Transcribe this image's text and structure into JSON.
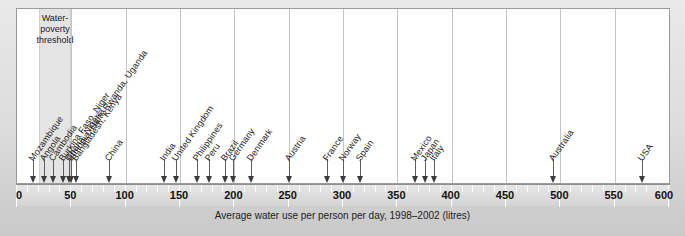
{
  "chart_data": {
    "type": "scatter",
    "title": "",
    "subtitle": "",
    "xlabel": "Average water use per person per day, 1998–2002 (litres)",
    "ylabel": "",
    "xlim": [
      0,
      600
    ],
    "xticks": [
      0,
      50,
      100,
      150,
      200,
      250,
      300,
      350,
      400,
      450,
      500,
      550,
      600
    ],
    "minor_tick_step": 10,
    "grid": "vertical-major",
    "legend": "none",
    "annotations": [
      {
        "label": "Water-poverty threshold",
        "range": [
          20,
          50
        ],
        "type": "shaded-band"
      }
    ],
    "categories": [
      "Mozambique",
      "Angola",
      "Cambodia",
      "Burkina Faso",
      "Ghana",
      "Ethiopia",
      "Nigeria",
      "Haiti",
      "Niger",
      "Rwanda",
      "Bangladesh",
      "Uganda",
      "Kenya",
      "China",
      "India",
      "United Kingdom",
      "Philippines",
      "Peru",
      "Brazil",
      "Germany",
      "Denmark",
      "Austria",
      "France",
      "Norway",
      "Spain",
      "Mexico",
      "Japan",
      "Italy",
      "Australia",
      "USA"
    ],
    "values": [
      15,
      25,
      33,
      42,
      50,
      50,
      50,
      50,
      50,
      50,
      50,
      50,
      50,
      85,
      135,
      145,
      165,
      175,
      190,
      195,
      215,
      250,
      285,
      300,
      315,
      366,
      374,
      383,
      493,
      575
    ],
    "marker_groups": [
      {
        "label": "Mozambique",
        "x": 15
      },
      {
        "label": "Angola",
        "x": 25
      },
      {
        "label": "Cambodia",
        "x": 33
      },
      {
        "label": "Burkina Faso",
        "x": 42
      },
      {
        "label": "Ghana, Nigeria",
        "x": 50
      },
      {
        "label": "Ethiopia, Haiti, Rwanda, Uganda",
        "x": 50
      },
      {
        "label": "Bangladesh, Kenya",
        "x": 50
      },
      {
        "label": "Niger",
        "x": 50
      },
      {
        "label": "China",
        "x": 85
      },
      {
        "label": "India",
        "x": 135
      },
      {
        "label": "United Kingdom",
        "x": 145
      },
      {
        "label": "Philippines",
        "x": 165
      },
      {
        "label": "Peru",
        "x": 175
      },
      {
        "label": "Brazil",
        "x": 190
      },
      {
        "label": "Germany",
        "x": 195
      },
      {
        "label": "Denmark",
        "x": 215
      },
      {
        "label": "Austria",
        "x": 250
      },
      {
        "label": "France",
        "x": 285
      },
      {
        "label": "Norway",
        "x": 300
      },
      {
        "label": "Spain",
        "x": 315
      },
      {
        "label": "Mexico",
        "x": 366
      },
      {
        "label": "Japan",
        "x": 374
      },
      {
        "label": "Italy",
        "x": 383
      },
      {
        "label": "Australia",
        "x": 493
      },
      {
        "label": "USA",
        "x": 575
      }
    ]
  },
  "band": {
    "line1": "Water-",
    "line2": "poverty",
    "line3": "threshold",
    "start": 20,
    "end": 50,
    "color": "#e4e4e4"
  },
  "axis": {
    "caption": "Average water use per person per day, 1998–2002 (litres)",
    "tick_labels": [
      "0",
      "50",
      "100",
      "150",
      "200",
      "250",
      "300",
      "350",
      "400",
      "450",
      "500",
      "550",
      "600"
    ]
  },
  "arrows": [
    {
      "name": "mozambique",
      "x": 15,
      "label": "Mozambique",
      "label_x": 15,
      "stem": 18
    },
    {
      "name": "angola",
      "x": 25,
      "label": "Angola",
      "label_x": 25,
      "stem": 18
    },
    {
      "name": "cambodia",
      "x": 33,
      "label": "Cambodia",
      "label_x": 33,
      "stem": 18
    },
    {
      "name": "burkina-faso-niger",
      "x": 42,
      "label": "Burkina Faso, Niger",
      "label_x": 42,
      "stem": 18
    },
    {
      "name": "ghana-nigeria",
      "x": 48,
      "label": "Ghana, Nigeria",
      "label_x": 48,
      "stem": 18
    },
    {
      "name": "bangladesh-kenya",
      "x": 54,
      "label": "Bangladesh, Kenya",
      "label_x": 54,
      "stem": 18
    },
    {
      "name": "ethiopia-haiti-rwanda-uganda",
      "x": 50,
      "label": "Ethiopia, Haiti, Rwanda, Uganda",
      "label_x": 50,
      "stem": 18
    },
    {
      "name": "china",
      "x": 85,
      "label": "China",
      "label_x": 85,
      "stem": 18
    },
    {
      "name": "india",
      "x": 135,
      "label": "India",
      "label_x": 135,
      "stem": 18
    },
    {
      "name": "united-kingdom",
      "x": 146,
      "label": "United Kingdom",
      "label_x": 146,
      "stem": 18
    },
    {
      "name": "philippines",
      "x": 166,
      "label": "Philippines",
      "label_x": 166,
      "stem": 18
    },
    {
      "name": "peru",
      "x": 177,
      "label": "Peru",
      "label_x": 177,
      "stem": 18
    },
    {
      "name": "brazil",
      "x": 191,
      "label": "Brazil",
      "label_x": 191,
      "stem": 18
    },
    {
      "name": "germany",
      "x": 199,
      "label": "Germany",
      "label_x": 199,
      "stem": 18
    },
    {
      "name": "denmark",
      "x": 215,
      "label": "Denmark",
      "label_x": 215,
      "stem": 18
    },
    {
      "name": "austria",
      "x": 250,
      "label": "Austria",
      "label_x": 250,
      "stem": 18
    },
    {
      "name": "france",
      "x": 285,
      "label": "France",
      "label_x": 285,
      "stem": 18
    },
    {
      "name": "norway",
      "x": 300,
      "label": "Norway",
      "label_x": 300,
      "stem": 18
    },
    {
      "name": "spain",
      "x": 316,
      "label": "Spain",
      "label_x": 316,
      "stem": 18
    },
    {
      "name": "mexico",
      "x": 366,
      "label": "Mexico",
      "label_x": 366,
      "stem": 18
    },
    {
      "name": "japan",
      "x": 375,
      "label": "Japan",
      "label_x": 375,
      "stem": 18
    },
    {
      "name": "italy",
      "x": 384,
      "label": "Italy",
      "label_x": 384,
      "stem": 18
    },
    {
      "name": "australia",
      "x": 493,
      "label": "Australia",
      "label_x": 493,
      "stem": 18
    },
    {
      "name": "usa",
      "x": 575,
      "label": "USA",
      "label_x": 575,
      "stem": 18
    }
  ]
}
